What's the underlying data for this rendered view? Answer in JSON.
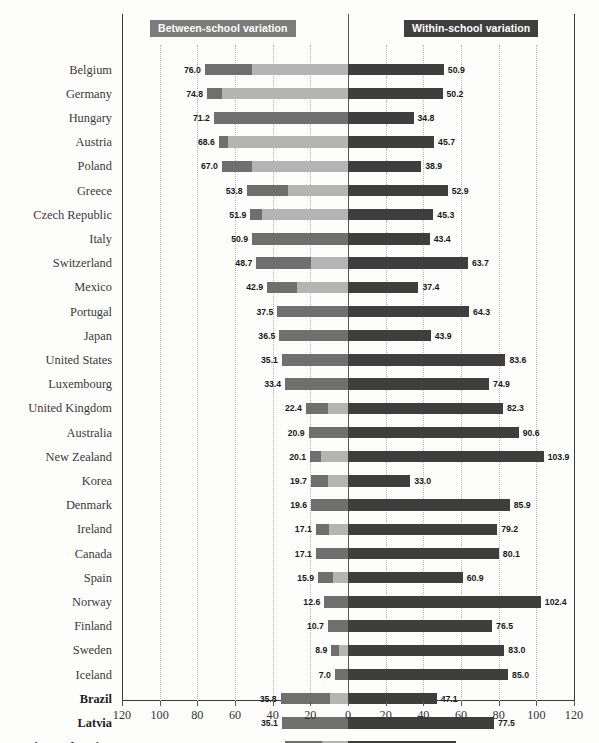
{
  "legend": {
    "left_label": "Between-school variation",
    "right_label": "Within-school variation",
    "left_color": "#7c7c7c",
    "right_color": "#3f3f3f"
  },
  "colors": {
    "bar_left_dark": "#6f6f6f",
    "bar_left_light": "#b4b4b4",
    "bar_right": "#3e3e3e",
    "gridline": "#b4b4b4",
    "axis": "#3a3a3a"
  },
  "chart_data": {
    "type": "bar",
    "orientation": "horizontal",
    "style": "diverging-bidirectional",
    "title": "",
    "xlabel": "",
    "ylabel": "",
    "xlim": [
      -120,
      120
    ],
    "xticks": [
      120,
      100,
      80,
      60,
      40,
      20,
      0,
      20,
      40,
      60,
      80,
      100,
      120
    ],
    "grid": true,
    "grid_axis": "x",
    "legend_position": "top",
    "zero_at_center": true,
    "series": [
      {
        "name": "Between-school variation",
        "side": "left",
        "color": "#7c7c7c"
      },
      {
        "name": "Within-school variation",
        "side": "right",
        "color": "#3e3e3e"
      }
    ],
    "categories": [
      "Belgium",
      "Germany",
      "Hungary",
      "Austria",
      "Poland",
      "Greece",
      "Czech Republic",
      "Italy",
      "Switzerland",
      "Mexico",
      "Portugal",
      "Japan",
      "United States",
      "Luxembourg",
      "United Kingdom",
      "Australia",
      "New Zealand",
      "Korea",
      "Denmark",
      "Ireland",
      "Canada",
      "Spain",
      "Norway",
      "Finland",
      "Sweden",
      "Iceland",
      "Brazil",
      "Latvia",
      "Russian Federation"
    ],
    "between_school": [
      76.0,
      74.8,
      71.2,
      68.6,
      67.0,
      53.8,
      51.9,
      50.9,
      48.7,
      42.9,
      37.5,
      36.5,
      35.1,
      33.4,
      22.4,
      20.9,
      20.1,
      19.7,
      19.6,
      17.1,
      17.1,
      15.9,
      12.6,
      10.7,
      8.9,
      7.0,
      35.8,
      35.1,
      33.6
    ],
    "between_school_dark_part": [
      25.0,
      8.0,
      71.2,
      5.0,
      16.0,
      22.0,
      6.0,
      50.9,
      29.0,
      16.0,
      37.5,
      36.5,
      35.1,
      33.4,
      12.0,
      20.9,
      6.0,
      9.0,
      19.6,
      7.0,
      17.1,
      8.0,
      12.6,
      10.7,
      4.0,
      7.0,
      26.0,
      35.1,
      20.0
    ],
    "within_school": [
      50.9,
      50.2,
      34.8,
      45.7,
      38.9,
      52.9,
      45.3,
      43.4,
      63.7,
      37.4,
      64.3,
      43.9,
      83.6,
      74.9,
      82.3,
      90.6,
      103.9,
      33.0,
      85.9,
      79.2,
      80.1,
      60.9,
      102.4,
      76.5,
      83.0,
      85.0,
      47.1,
      77.5,
      57.1
    ],
    "bold_categories": [
      "Brazil",
      "Latvia",
      "Russian Federation"
    ]
  }
}
